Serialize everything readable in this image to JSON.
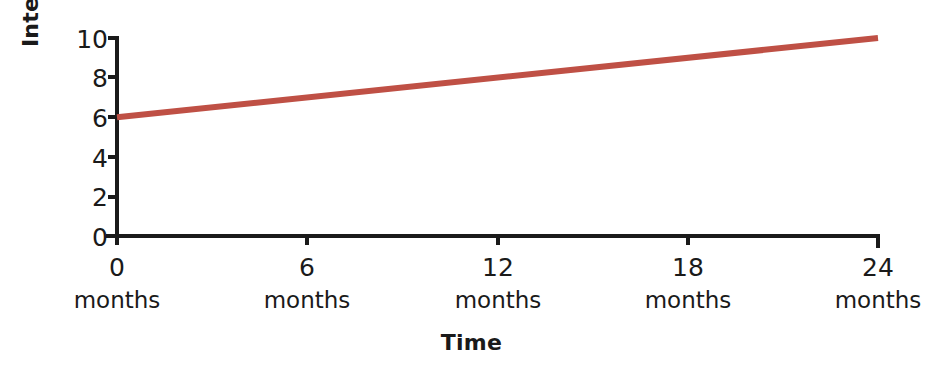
{
  "chart_data": {
    "type": "line",
    "title": "",
    "xlabel": "Time",
    "ylabel": "Interest rate",
    "x": [
      0,
      6,
      12,
      18,
      24
    ],
    "x_tick_labels": [
      "0",
      "6",
      "12",
      "18",
      "24"
    ],
    "x_tick_units": [
      "months",
      "months",
      "months",
      "months",
      "months"
    ],
    "xlim": [
      0,
      24
    ],
    "y_tick_labels": [
      "10",
      "8",
      "6",
      "4",
      "2",
      "0"
    ],
    "y_ticks": [
      10,
      8,
      6,
      4,
      2,
      0
    ],
    "ylim": [
      0,
      10
    ],
    "grid": false,
    "legend": "none",
    "series": [
      {
        "name": "Interest rate",
        "color": "#bf5045",
        "values": [
          6,
          7,
          8,
          9,
          10
        ]
      }
    ]
  },
  "axes": {
    "y_title": "Interest rate",
    "x_title": "Time"
  },
  "colors": {
    "line": "#bf5045",
    "axis": "#1a1a1a",
    "background": "#ffffff",
    "text": "#1a1a1a"
  }
}
